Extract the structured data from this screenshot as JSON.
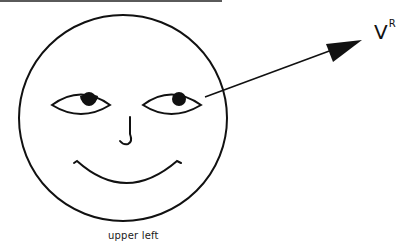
{
  "figure": {
    "caption": "upper left",
    "vector_label": {
      "base": "V",
      "superscript": "R"
    },
    "elements": [
      "face-circle",
      "left-eye",
      "right-eye",
      "nose",
      "smile",
      "gaze-vector-arrow"
    ],
    "colors": {
      "ink": "#111111",
      "background": "#ffffff"
    }
  }
}
